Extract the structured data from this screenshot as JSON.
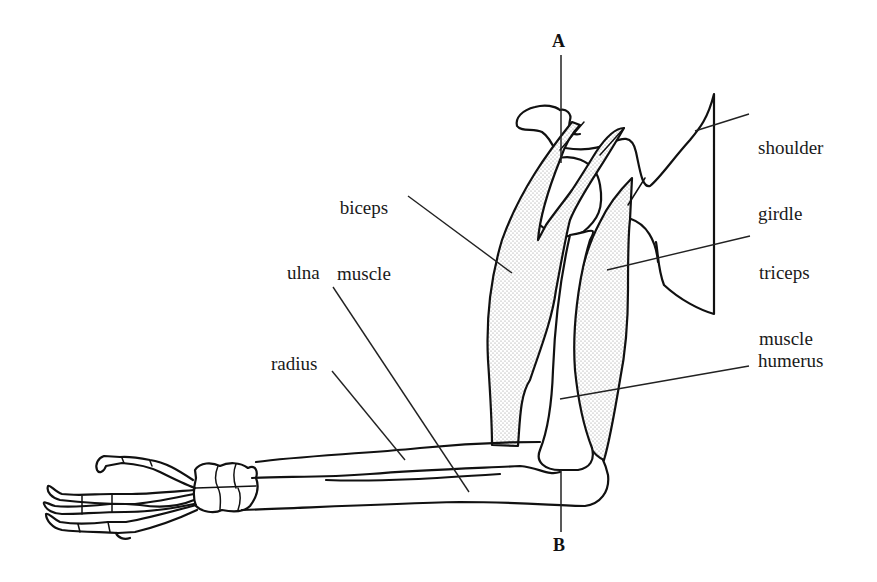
{
  "diagram": {
    "markers": {
      "top": "A",
      "bottom": "B"
    },
    "labels": {
      "shoulder_girdle": {
        "line1": "shoulder",
        "line2": "girdle"
      },
      "biceps_muscle": {
        "line1": "biceps",
        "line2": "muscle"
      },
      "triceps_muscle": {
        "line1": "triceps",
        "line2": "muscle"
      },
      "ulna": "ulna",
      "radius": "radius",
      "humerus": "humerus"
    },
    "colors": {
      "line": "#111111",
      "muscle_stipple": "#9a9a9a",
      "background": "#ffffff"
    }
  }
}
